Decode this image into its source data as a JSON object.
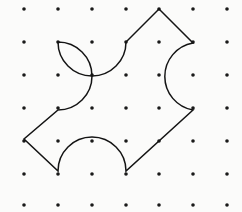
{
  "canvas": {
    "width": 242,
    "height": 212,
    "background_color": "#fbfbfa"
  },
  "lattice": {
    "label": "dot-grid",
    "columns": 7,
    "rows": 7,
    "origin_x": 24,
    "origin_y": 9,
    "spacing_x": 33.8,
    "spacing_y": 32.7,
    "dot_radius": 1.8,
    "dot_color": "#1a1a1a",
    "x_positions": [
      24,
      58,
      92,
      126,
      159,
      193,
      227
    ],
    "y_positions": [
      9,
      42,
      75,
      108,
      141,
      174,
      205
    ]
  },
  "figure": {
    "name": "pinwheel-curved-polygon",
    "stroke_color": "#141414",
    "stroke_width": 1.5,
    "fill": "none",
    "arc_radius": 34,
    "vertices": [
      {
        "name": "top-arc-left",
        "x": 58,
        "y": 42
      },
      {
        "name": "top-arc-right",
        "x": 126,
        "y": 42
      },
      {
        "name": "top-point",
        "x": 159,
        "y": 9
      },
      {
        "name": "right-arc-top",
        "x": 193,
        "y": 43
      },
      {
        "name": "right-arc-bottom",
        "x": 193,
        "y": 110
      },
      {
        "name": "bottom-right-point",
        "x": 126,
        "y": 171
      },
      {
        "name": "bottom-arc-right",
        "x": 126,
        "y": 171
      },
      {
        "name": "bottom-arc-left",
        "x": 58,
        "y": 171
      },
      {
        "name": "left-point",
        "x": 24,
        "y": 139
      },
      {
        "name": "left-arc-bottom",
        "x": 58,
        "y": 110
      },
      {
        "name": "left-arc-top",
        "x": 58,
        "y": 42
      }
    ],
    "path": "M 58 42 A 34 34 0 0 0 126 42 L 159 9 L 193 43 A 34 34 0 0 0 193 110 L 126 171 A 34 34 0 0 0 58 171 L 24 139 L 58 110 A 34 34 0 0 0 58 42 Z",
    "segments": [
      {
        "type": "arc",
        "name": "top-concave-arc",
        "from": "top-arc-left",
        "to": "top-arc-right",
        "bulge": "downward"
      },
      {
        "type": "line",
        "name": "top-left-edge",
        "from": "top-arc-right",
        "to": "top-point"
      },
      {
        "type": "line",
        "name": "top-right-edge",
        "from": "top-point",
        "to": "right-arc-top"
      },
      {
        "type": "arc",
        "name": "right-concave-arc",
        "from": "right-arc-top",
        "to": "right-arc-bottom",
        "bulge": "leftward"
      },
      {
        "type": "line",
        "name": "bottom-right-edge",
        "from": "right-arc-bottom",
        "to": "bottom-right-point"
      },
      {
        "type": "arc",
        "name": "bottom-concave-arc",
        "from": "bottom-arc-right",
        "to": "bottom-arc-left",
        "bulge": "upward"
      },
      {
        "type": "line",
        "name": "bottom-left-edge",
        "from": "bottom-arc-left",
        "to": "left-point"
      },
      {
        "type": "line",
        "name": "upper-left-edge",
        "from": "left-point",
        "to": "left-arc-bottom"
      },
      {
        "type": "arc",
        "name": "left-concave-arc",
        "from": "left-arc-bottom",
        "to": "left-arc-top",
        "bulge": "rightward"
      }
    ]
  }
}
